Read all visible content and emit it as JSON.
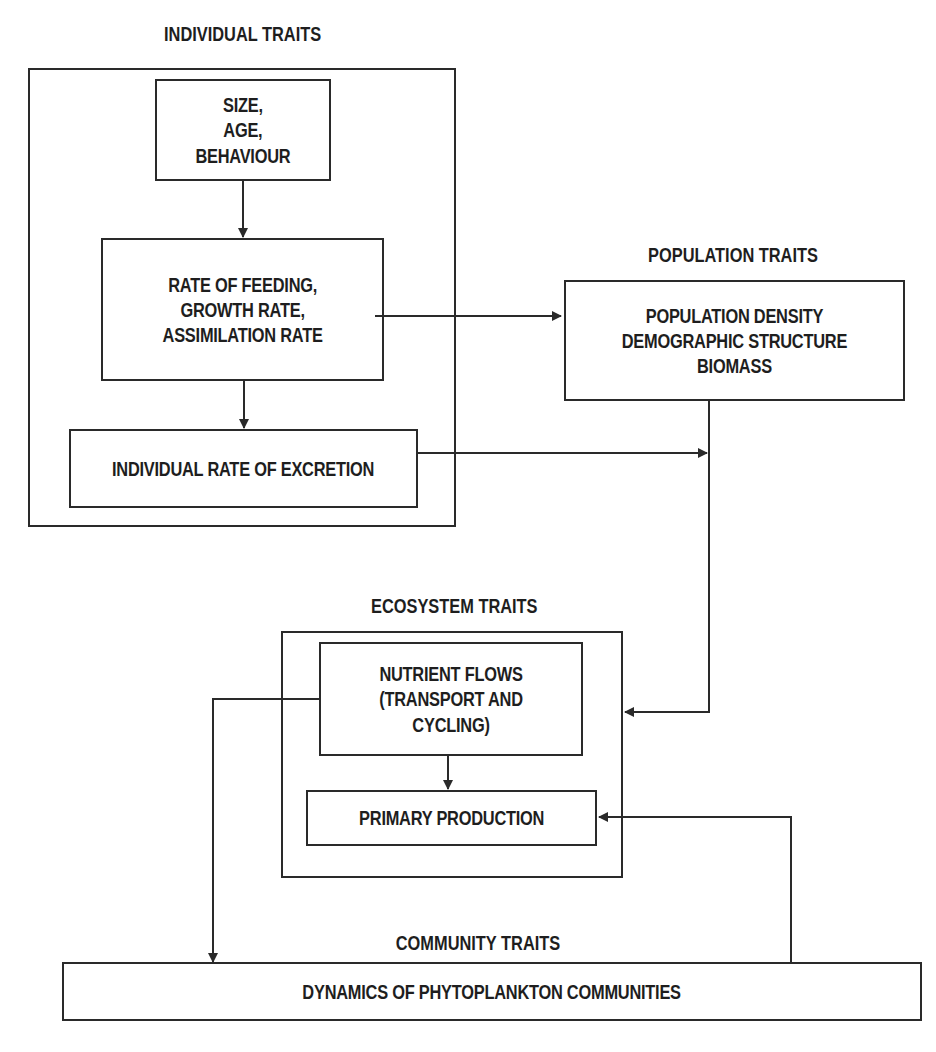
{
  "diagram": {
    "type": "flowchart",
    "line_color": "#2a2a2a",
    "background": "#ffffff",
    "groups": {
      "individual": {
        "title": "INDIVIDUAL TRAITS",
        "nodes": {
          "size": "SIZE,\nAGE,\nBEHAVIOUR",
          "feeding": "RATE OF FEEDING,\nGROWTH RATE,\nASSIMILATION RATE",
          "excretion": "INDIVIDUAL RATE OF EXCRETION"
        }
      },
      "population": {
        "title": "POPULATION TRAITS",
        "nodes": {
          "density": "POPULATION DENSITY\nDEMOGRAPHIC STRUCTURE\nBIOMASS"
        }
      },
      "ecosystem": {
        "title": "ECOSYSTEM TRAITS",
        "nodes": {
          "nutrient": "NUTRIENT FLOWS\n(TRANSPORT AND CYCLING)",
          "primary": "PRIMARY PRODUCTION"
        }
      },
      "community": {
        "title": "COMMUNITY TRAITS",
        "nodes": {
          "dynamics": "DYNAMICS OF PHYTOPLANKTON COMMUNITIES"
        }
      }
    },
    "edges": [
      {
        "from": "size",
        "to": "feeding"
      },
      {
        "from": "feeding",
        "to": "excretion"
      },
      {
        "from": "feeding",
        "to": "density"
      },
      {
        "from": "excretion",
        "to": "density-to-ecosystem-line"
      },
      {
        "from": "density",
        "to": "ecosystem"
      },
      {
        "from": "nutrient",
        "to": "primary"
      },
      {
        "from": "nutrient",
        "to": "dynamics"
      },
      {
        "from": "dynamics",
        "to": "primary"
      }
    ]
  }
}
